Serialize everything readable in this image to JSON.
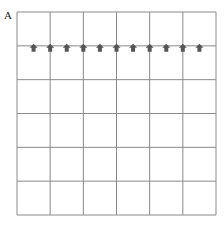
{
  "panel_label": "A",
  "grid": {
    "columns": 6,
    "rows": 6,
    "line_color": "#8a8a8a"
  },
  "arrows": {
    "count": 11,
    "direction": "up",
    "row_line": 1,
    "color": "#555555"
  }
}
